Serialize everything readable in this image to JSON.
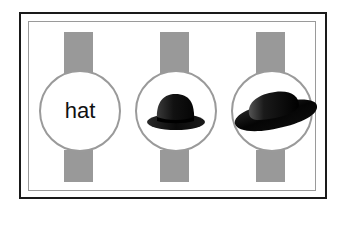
{
  "panels": [
    {
      "type": "text",
      "label": "hat"
    },
    {
      "type": "image",
      "icon": "bowler-hat-icon"
    },
    {
      "type": "image",
      "icon": "wide-brim-hat-icon"
    }
  ],
  "colors": {
    "frame": "#1a1a1a",
    "inner_frame": "#9a9a9a",
    "bar": "#999999",
    "circle_border": "#9a9a9a",
    "hat": "#111111"
  }
}
